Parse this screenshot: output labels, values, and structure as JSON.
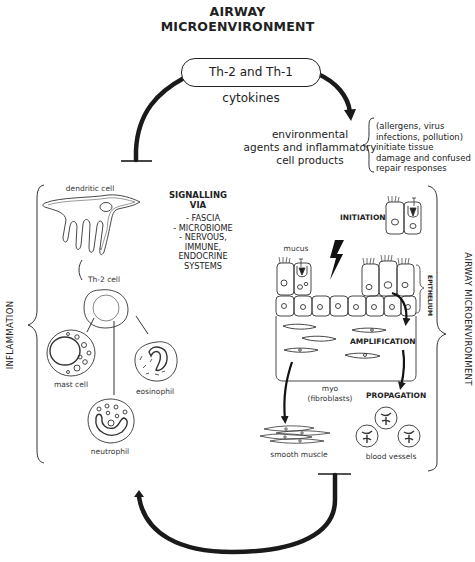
{
  "title": {
    "line1": "AIRWAY",
    "line2": "MICROENVIRONMENT"
  },
  "top_loop": {
    "pill_label": "Th-2 and Th-1 cytokines"
  },
  "environment": {
    "line1": "environmental",
    "line2": "agents and inflammatory",
    "line3": "cell products",
    "note_lines": [
      "(allergens, virus",
      "infections, pollution)",
      "initiate tissue",
      "damage and confused",
      "repair responses"
    ]
  },
  "signalling": {
    "title_line1": "SIGNALLING",
    "title_line2": "VIA",
    "items": [
      "- FASCIA",
      "- MICROBIOME",
      "- NERVOUS,",
      "IMMUNE,",
      "ENDOCRINE",
      "SYSTEMS"
    ]
  },
  "inflammation": {
    "side_label": "INFLAMMATION",
    "cells": {
      "dendritic": "dendritic cell",
      "th2": "Th-2 cell",
      "mast": "mast cell",
      "eosinophil": "eosinophil",
      "neutrophil": "neutrophil"
    }
  },
  "airway": {
    "side_label": "AIRWAY MICROENVIRONMENT",
    "epithelium_label": "EPITHELIUM",
    "initiation_label": "INITIATION",
    "mucus_label": "mucus",
    "amplification_label": "AMPLIFICATION",
    "propagation_label": "PROPAGATION",
    "myo_line1": "myo",
    "myo_line2": "(fibroblasts)",
    "smooth_muscle_label": "smooth muscle",
    "blood_vessels_label": "blood vessels"
  },
  "colors": {
    "ink": "#222222",
    "background": "#ffffff"
  }
}
